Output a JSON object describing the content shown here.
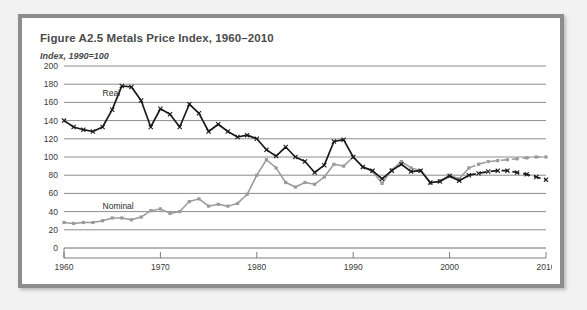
{
  "figure": {
    "title": "Figure A2.5  Metals Price Index, 1960–2010",
    "subtitle": "Index, 1990=100"
  },
  "chart_data": {
    "type": "line",
    "title": "Figure A2.5  Metals Price Index, 1960–2010",
    "subtitle": "Index, 1990=100",
    "xlabel": "",
    "ylabel": "Index, 1990=100",
    "xlim": [
      1960,
      2010
    ],
    "ylim": [
      0,
      200
    ],
    "yticks": [
      0,
      20,
      40,
      60,
      80,
      100,
      120,
      140,
      160,
      180,
      200
    ],
    "xticks": [
      1960,
      1970,
      1980,
      1990,
      2000,
      2010
    ],
    "grid": "horizontal",
    "legend": "inline-labels",
    "annotations": [
      {
        "text": "Real",
        "x": 1964,
        "y": 167
      },
      {
        "text": "Nominal",
        "x": 1964,
        "y": 43
      }
    ],
    "forecast_start": 2002,
    "x": [
      1960,
      1961,
      1962,
      1963,
      1964,
      1965,
      1966,
      1967,
      1968,
      1969,
      1970,
      1971,
      1972,
      1973,
      1974,
      1975,
      1976,
      1977,
      1978,
      1979,
      1980,
      1981,
      1982,
      1983,
      1984,
      1985,
      1986,
      1987,
      1988,
      1989,
      1990,
      1991,
      1992,
      1993,
      1994,
      1995,
      1996,
      1997,
      1998,
      1999,
      2000,
      2001,
      2002,
      2003,
      2004,
      2005,
      2006,
      2007,
      2008,
      2009,
      2010
    ],
    "series": [
      {
        "name": "Real",
        "color": "#1a1a1a",
        "marker": "x",
        "values": [
          140,
          133,
          130,
          128,
          133,
          152,
          178,
          177,
          162,
          133,
          153,
          147,
          133,
          158,
          148,
          128,
          136,
          128,
          122,
          124,
          120,
          108,
          101,
          111,
          100,
          95,
          83,
          91,
          117,
          119,
          100,
          89,
          85,
          76,
          85,
          92,
          84,
          85,
          72,
          73,
          79,
          74,
          80,
          82,
          84,
          85,
          85,
          83,
          81,
          78,
          75
        ]
      },
      {
        "name": "Nominal",
        "color": "#9a9a9a",
        "marker": "square",
        "values": [
          28,
          27,
          28,
          28,
          30,
          33,
          33,
          31,
          34,
          41,
          43,
          38,
          40,
          51,
          54,
          46,
          48,
          46,
          49,
          59,
          80,
          97,
          88,
          72,
          67,
          72,
          70,
          78,
          92,
          90,
          100,
          89,
          84,
          71,
          86,
          95,
          88,
          85,
          71,
          74,
          80,
          76,
          88,
          92,
          95,
          96,
          97,
          98,
          99,
          100,
          100
        ]
      }
    ]
  }
}
